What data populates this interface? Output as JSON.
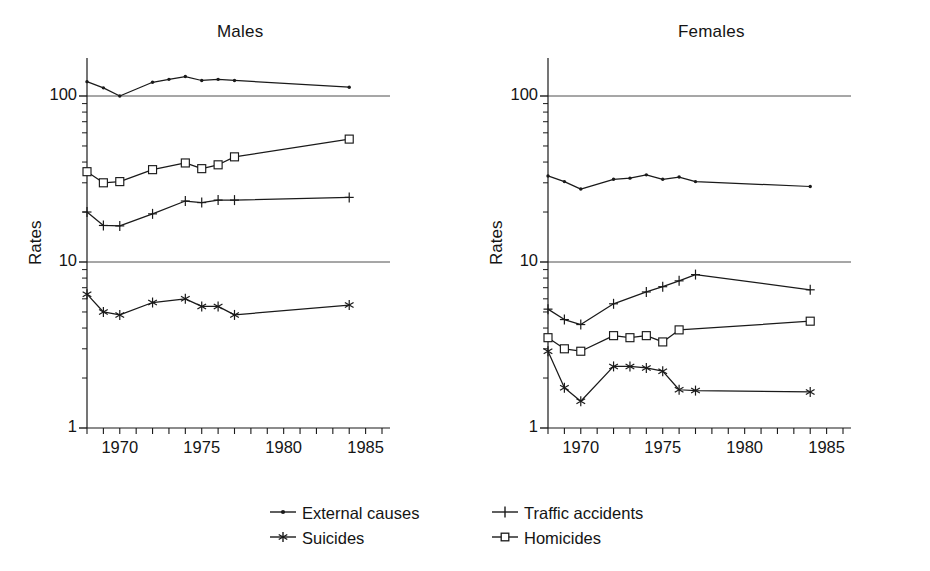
{
  "figure": {
    "background": "#ffffff",
    "ink_color": "#1a1a1a"
  },
  "panels": [
    {
      "key": "males",
      "title": "Males",
      "ylabel": "Rates"
    },
    {
      "key": "females",
      "title": "Females",
      "ylabel": "Rates"
    }
  ],
  "legend": {
    "items": [
      {
        "label": "External causes",
        "marker": "dot-icon",
        "color": "#1a1a1a"
      },
      {
        "label": "Suicides",
        "marker": "asterisk-icon",
        "color": "#1a1a1a"
      },
      {
        "label": "Traffic accidents",
        "marker": "plus-icon",
        "color": "#1a1a1a"
      },
      {
        "label": "Homicides",
        "marker": "open-square-icon",
        "color": "#1a1a1a"
      }
    ]
  },
  "chart_data": [
    {
      "type": "line",
      "title": "Males",
      "xlabel": "",
      "ylabel": "Rates",
      "yscale": "log",
      "ylim": [
        1,
        300
      ],
      "xlim": [
        1968,
        1986
      ],
      "yticks": [
        1,
        10,
        100
      ],
      "ytick_labels": [
        "1",
        "10",
        "100"
      ],
      "xticks": [
        1968,
        1969,
        1970,
        1971,
        1972,
        1973,
        1974,
        1975,
        1976,
        1977,
        1978,
        1979,
        1980,
        1981,
        1982,
        1983,
        1984,
        1985,
        1986
      ],
      "xtick_labels": [
        "",
        "",
        "1970",
        "",
        "",
        "",
        "",
        "1975",
        "",
        "",
        "",
        "",
        "1980",
        "",
        "",
        "",
        "",
        "1985",
        ""
      ],
      "grid": "horizontal-at-10-and-100",
      "legend_position": "below-figure",
      "series": [
        {
          "name": "External causes",
          "marker": "dot",
          "x": [
            1968,
            1969,
            1970,
            1972,
            1973,
            1974,
            1975,
            1976,
            1977,
            1984
          ],
          "values": [
            122,
            112,
            100,
            121,
            126,
            131,
            124,
            126,
            124,
            113
          ]
        },
        {
          "name": "Homicides",
          "marker": "open-square",
          "x": [
            1968,
            1969,
            1970,
            1972,
            1974,
            1975,
            1976,
            1977,
            1984
          ],
          "values": [
            35,
            30,
            30.5,
            36,
            39.5,
            36.5,
            38.5,
            43,
            55
          ]
        },
        {
          "name": "Traffic accidents",
          "marker": "plus",
          "x": [
            1968,
            1969,
            1970,
            1972,
            1974,
            1975,
            1976,
            1977,
            1984
          ],
          "values": [
            20,
            16.6,
            16.5,
            19.5,
            23.3,
            22.8,
            23.6,
            23.6,
            24.5
          ]
        },
        {
          "name": "Suicides",
          "marker": "asterisk",
          "x": [
            1968,
            1969,
            1970,
            1972,
            1974,
            1975,
            1976,
            1977,
            1984
          ],
          "values": [
            6.4,
            5.0,
            4.8,
            5.7,
            6.0,
            5.4,
            5.4,
            4.8,
            5.5
          ]
        }
      ]
    },
    {
      "type": "line",
      "title": "Females",
      "xlabel": "",
      "ylabel": "Rates",
      "yscale": "log",
      "ylim": [
        1,
        300
      ],
      "xlim": [
        1968,
        1986
      ],
      "yticks": [
        1,
        10,
        100
      ],
      "ytick_labels": [
        "1",
        "10",
        "100"
      ],
      "xticks": [
        1968,
        1969,
        1970,
        1971,
        1972,
        1973,
        1974,
        1975,
        1976,
        1977,
        1978,
        1979,
        1980,
        1981,
        1982,
        1983,
        1984,
        1985,
        1986
      ],
      "xtick_labels": [
        "",
        "",
        "1970",
        "",
        "",
        "",
        "",
        "1975",
        "",
        "",
        "",
        "",
        "1980",
        "",
        "",
        "",
        "",
        "1985",
        ""
      ],
      "grid": "horizontal-at-10-and-100",
      "legend_position": "below-figure",
      "series": [
        {
          "name": "External causes",
          "marker": "dot",
          "x": [
            1968,
            1969,
            1970,
            1972,
            1973,
            1974,
            1975,
            1976,
            1977,
            1984
          ],
          "values": [
            33,
            30.5,
            27.5,
            31.5,
            32,
            33.5,
            31.5,
            32.5,
            30.5,
            28.5
          ]
        },
        {
          "name": "Traffic accidents",
          "marker": "plus",
          "x": [
            1968,
            1969,
            1970,
            1972,
            1974,
            1975,
            1976,
            1977,
            1984
          ],
          "values": [
            5.2,
            4.5,
            4.2,
            5.6,
            6.6,
            7.1,
            7.7,
            8.4,
            6.8
          ]
        },
        {
          "name": "Homicides",
          "marker": "open-square",
          "x": [
            1968,
            1969,
            1970,
            1972,
            1973,
            1974,
            1975,
            1976,
            1984
          ],
          "values": [
            3.5,
            3.0,
            2.9,
            3.6,
            3.5,
            3.6,
            3.3,
            3.9,
            4.4
          ]
        },
        {
          "name": "Suicides",
          "marker": "asterisk",
          "x": [
            1968,
            1969,
            1970,
            1972,
            1973,
            1974,
            1975,
            1976,
            1977,
            1984
          ],
          "values": [
            2.9,
            1.75,
            1.45,
            2.35,
            2.35,
            2.3,
            2.2,
            1.7,
            1.68,
            1.65
          ]
        }
      ]
    }
  ]
}
